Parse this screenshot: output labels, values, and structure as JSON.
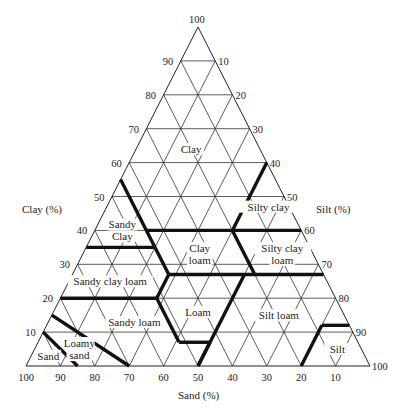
{
  "chart_data": {
    "type": "ternary",
    "axes": {
      "clay": {
        "label": "Clay (%)",
        "side": "left",
        "ticks": [
          10,
          20,
          30,
          40,
          50,
          60,
          70,
          80,
          90,
          100
        ]
      },
      "silt": {
        "label": "Silt (%)",
        "side": "right",
        "ticks": [
          10,
          20,
          30,
          40,
          50,
          60,
          70,
          80,
          90,
          100
        ]
      },
      "sand": {
        "label": "Sand (%)",
        "side": "bottom",
        "ticks": [
          100,
          90,
          80,
          70,
          60,
          50,
          40,
          30,
          20,
          10
        ]
      }
    },
    "grid_step": 10,
    "regions": [
      {
        "name": "Clay",
        "label_lines": [
          "Clay"
        ],
        "clay": 64,
        "sand": 20
      },
      {
        "name": "Sandy clay",
        "label_lines": [
          "Sandy",
          "Clay"
        ],
        "clay": 40,
        "sand": 52
      },
      {
        "name": "Silty clay",
        "label_lines": [
          "Silty clay"
        ],
        "clay": 47,
        "sand": 6
      },
      {
        "name": "Clay loam",
        "label_lines": [
          "Clay",
          "loam"
        ],
        "clay": 33,
        "sand": 33
      },
      {
        "name": "Silty clay loam",
        "label_lines": [
          "Silty clay",
          "loam"
        ],
        "clay": 33,
        "sand": 9
      },
      {
        "name": "Sandy clay loam",
        "label_lines": [
          "Sandy clay loam"
        ],
        "clay": 25,
        "sand": 63
      },
      {
        "name": "Loam",
        "label_lines": [
          "Loam"
        ],
        "clay": 16,
        "sand": 42
      },
      {
        "name": "Silt loam",
        "label_lines": [
          "Silt loam"
        ],
        "clay": 15,
        "sand": 19
      },
      {
        "name": "Sandy loam",
        "label_lines": [
          "Sandy loam"
        ],
        "clay": 13,
        "sand": 62
      },
      {
        "name": "Loamy sand",
        "label_lines": [
          "Loamy",
          "sand"
        ],
        "clay": 5,
        "sand": 82
      },
      {
        "name": "Sand",
        "label_lines": [
          "Sand"
        ],
        "clay": 3,
        "sand": 92
      },
      {
        "name": "Silt",
        "label_lines": [
          "Silt"
        ],
        "clay": 5,
        "sand": 7
      }
    ],
    "boundaries": [
      [
        [
          55,
          45
        ],
        [
          40,
          45
        ]
      ],
      [
        [
          60,
          0
        ],
        [
          40,
          20
        ]
      ],
      [
        [
          40,
          45
        ],
        [
          40,
          0
        ]
      ],
      [
        [
          35,
          65
        ],
        [
          35,
          45
        ]
      ],
      [
        [
          40,
          45
        ],
        [
          27,
          45
        ]
      ],
      [
        [
          27,
          45
        ],
        [
          27,
          0
        ]
      ],
      [
        [
          40,
          20
        ],
        [
          27,
          20
        ]
      ],
      [
        [
          20,
          80
        ],
        [
          20,
          52
        ]
      ],
      [
        [
          20,
          52
        ],
        [
          27,
          45
        ]
      ],
      [
        [
          20,
          52
        ],
        [
          7,
          52
        ]
      ],
      [
        [
          7,
          52
        ],
        [
          7,
          43
        ]
      ],
      [
        [
          7,
          43
        ],
        [
          0,
          50
        ]
      ],
      [
        [
          0,
          50
        ],
        [
          27,
          23
        ]
      ],
      [
        [
          12,
          8
        ],
        [
          12,
          0
        ]
      ],
      [
        [
          12,
          8
        ],
        [
          0,
          20
        ]
      ],
      [
        [
          15,
          85
        ],
        [
          0,
          70
        ]
      ],
      [
        [
          10,
          90
        ],
        [
          0,
          85
        ]
      ]
    ],
    "boundary_point_format": "[clay%, sand%]"
  }
}
